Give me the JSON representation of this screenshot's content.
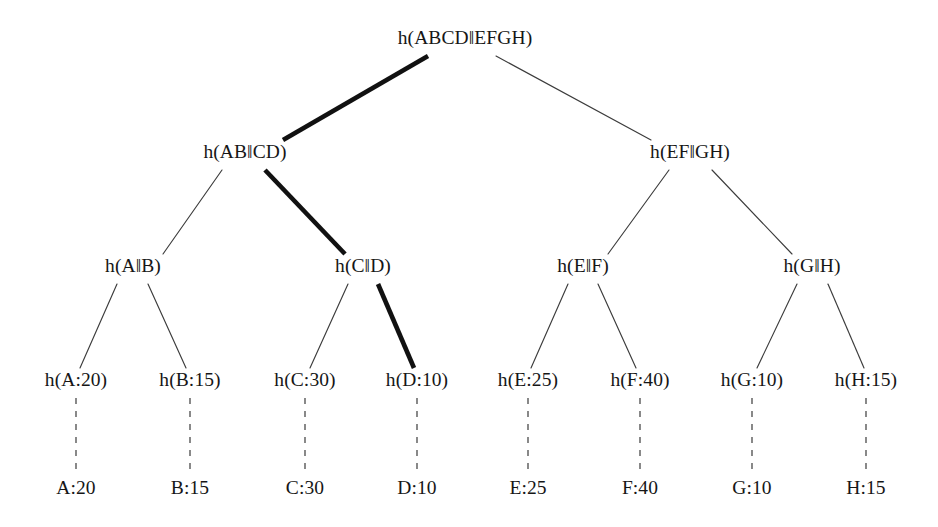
{
  "figure": {
    "type": "merkle-tree-diagram",
    "background_color": "#ffffff",
    "text_color": "#161616",
    "thin_edge_color": "#3c3c3c",
    "bold_edge_color": "#111111",
    "dashed_edge_color": "#4a4a4a"
  },
  "nodes": {
    "root": {
      "label": "h(ABCD‖EFGH)",
      "x": 465,
      "y": 44
    },
    "level2": [
      {
        "id": "ab-cd",
        "label": "h(AB‖CD)",
        "x": 245,
        "y": 158
      },
      {
        "id": "ef-gh",
        "label": "h(EF‖GH)",
        "x": 690,
        "y": 158
      }
    ],
    "level3": [
      {
        "id": "a-b",
        "label": "h(A‖B)",
        "x": 133,
        "y": 272
      },
      {
        "id": "c-d",
        "label": "h(C‖D)",
        "x": 363,
        "y": 272
      },
      {
        "id": "e-f",
        "label": "h(E‖F)",
        "x": 583,
        "y": 272
      },
      {
        "id": "g-h",
        "label": "h(G‖H)",
        "x": 812,
        "y": 272
      }
    ],
    "leaf_hashes": [
      {
        "id": "h-a",
        "label": "h(A:20)",
        "x": 76,
        "y": 386
      },
      {
        "id": "h-b",
        "label": "h(B:15)",
        "x": 190,
        "y": 386
      },
      {
        "id": "h-c",
        "label": "h(C:30)",
        "x": 305,
        "y": 386
      },
      {
        "id": "h-d",
        "label": "h(D:10)",
        "x": 417,
        "y": 386
      },
      {
        "id": "h-e",
        "label": "h(E:25)",
        "x": 528,
        "y": 386
      },
      {
        "id": "h-f",
        "label": "h(F:40)",
        "x": 640,
        "y": 386
      },
      {
        "id": "h-g",
        "label": "h(G:10)",
        "x": 752,
        "y": 386
      },
      {
        "id": "h-h",
        "label": "h(H:15)",
        "x": 866,
        "y": 386
      }
    ],
    "data_leaves": [
      {
        "id": "d-a",
        "label": "A:20",
        "x": 76,
        "y": 494
      },
      {
        "id": "d-b",
        "label": "B:15",
        "x": 190,
        "y": 494
      },
      {
        "id": "d-c",
        "label": "C:30",
        "x": 305,
        "y": 494
      },
      {
        "id": "d-d",
        "label": "D:10",
        "x": 417,
        "y": 494
      },
      {
        "id": "d-e",
        "label": "E:25",
        "x": 528,
        "y": 494
      },
      {
        "id": "d-f",
        "label": "F:40",
        "x": 640,
        "y": 494
      },
      {
        "id": "d-g",
        "label": "G:10",
        "x": 752,
        "y": 494
      },
      {
        "id": "d-h",
        "label": "H:15",
        "x": 866,
        "y": 494
      }
    ]
  },
  "highlighted_path": {
    "description": "bold authentication path",
    "node_ids": [
      "root",
      "ab-cd",
      "c-d",
      "h-d"
    ]
  }
}
